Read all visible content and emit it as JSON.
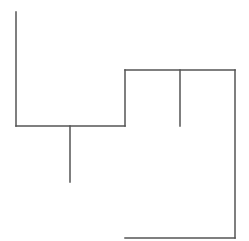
{
  "diagram": {
    "type": "tree-connector-lines",
    "background": "#ffffff",
    "stroke_color": "#555555",
    "stroke_width": 1.5,
    "segments": [
      {
        "id": "left-vertical",
        "x1": 16,
        "y1": 12,
        "x2": 16,
        "y2": 126
      },
      {
        "id": "lower-horizontal",
        "x1": 16,
        "y1": 126,
        "x2": 125,
        "y2": 126
      },
      {
        "id": "left-drop",
        "x1": 70,
        "y1": 126,
        "x2": 70,
        "y2": 182
      },
      {
        "id": "step-vertical",
        "x1": 125,
        "y1": 126,
        "x2": 125,
        "y2": 70
      },
      {
        "id": "upper-horizontal",
        "x1": 125,
        "y1": 70,
        "x2": 235,
        "y2": 70
      },
      {
        "id": "middle-drop",
        "x1": 180,
        "y1": 70,
        "x2": 180,
        "y2": 126
      },
      {
        "id": "right-vertical",
        "x1": 235,
        "y1": 70,
        "x2": 235,
        "y2": 238
      },
      {
        "id": "bottom-horizontal",
        "x1": 125,
        "y1": 238,
        "x2": 235,
        "y2": 238
      }
    ]
  }
}
